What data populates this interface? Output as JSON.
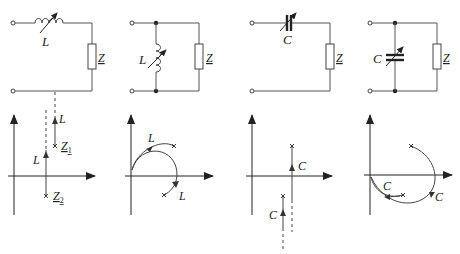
{
  "figure": {
    "panels": [
      {
        "id": "series-L",
        "circuit": {
          "topology": "series",
          "element": "variable inductor",
          "element_label": "L",
          "load_label": "Z"
        },
        "diagram": {
          "type": "impedance locus",
          "labels": {
            "locus_upper": "L",
            "locus_lower": "L",
            "point_1": "Z",
            "point_1_sub": "1",
            "point_2": "Z",
            "point_2_sub": "2"
          }
        }
      },
      {
        "id": "shunt-L",
        "circuit": {
          "topology": "shunt",
          "element": "variable inductor",
          "element_label": "L",
          "load_label": "Z"
        },
        "diagram": {
          "type": "admittance/impedance arcs",
          "labels": {
            "arc_upper": "L",
            "arc_lower": "L"
          }
        }
      },
      {
        "id": "series-C",
        "circuit": {
          "topology": "series",
          "element": "variable capacitor",
          "element_label": "C",
          "load_label": "Z"
        },
        "diagram": {
          "type": "impedance locus",
          "labels": {
            "locus_upper": "C",
            "locus_lower": "C"
          }
        }
      },
      {
        "id": "shunt-C",
        "circuit": {
          "topology": "shunt",
          "element": "variable capacitor",
          "element_label": "C",
          "load_label": "Z"
        },
        "diagram": {
          "type": "admittance/impedance arcs",
          "labels": {
            "arc_right": "C",
            "arc_inner": "C"
          }
        }
      }
    ]
  }
}
